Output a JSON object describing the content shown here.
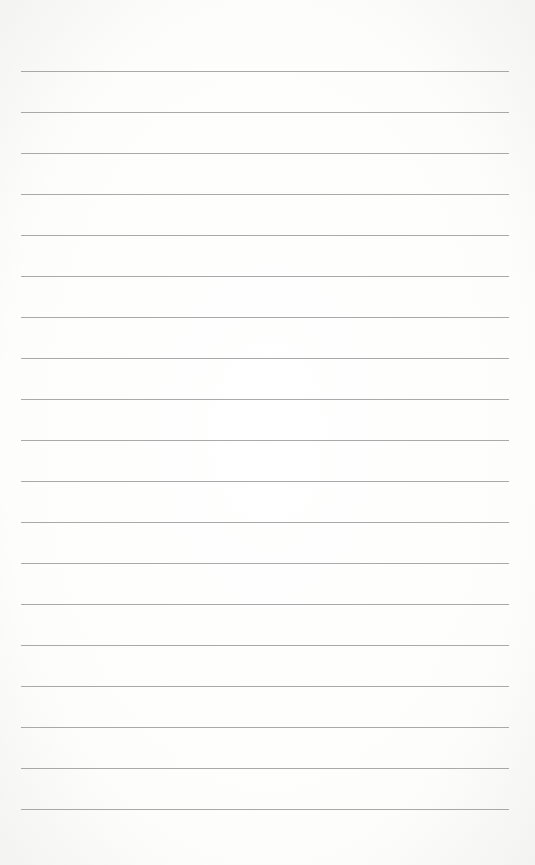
{
  "page": {
    "type": "lined-paper",
    "background_color": "#fdfdfc",
    "line_color": "#9a9a9a",
    "line_count": 19,
    "first_line_y": 71,
    "line_spacing": 41,
    "line_left_x": 21,
    "line_right_x": 509,
    "text_content": []
  }
}
